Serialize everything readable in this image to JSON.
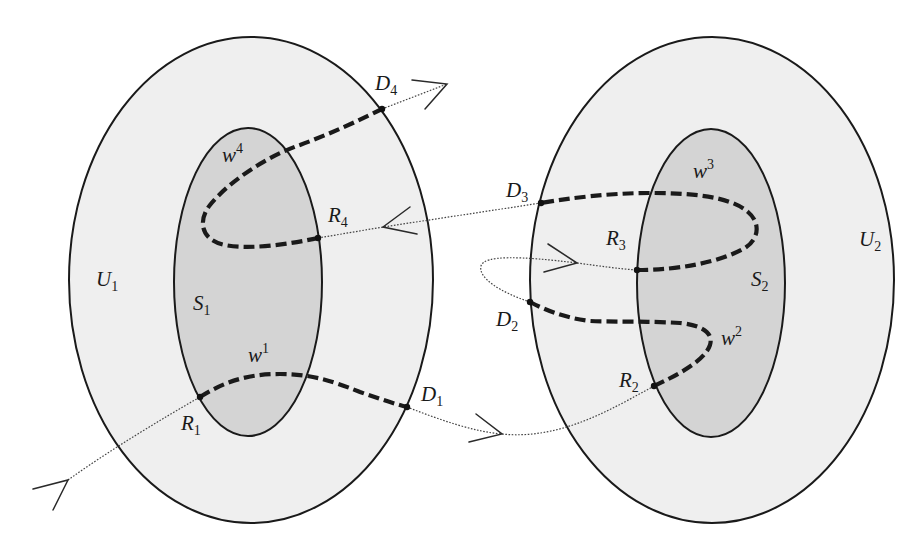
{
  "diagram": {
    "type": "set-trajectory-diagram",
    "regions": [
      {
        "id": "U1",
        "name": "U",
        "index": "1",
        "kind": "outer",
        "fill": "#efefef"
      },
      {
        "id": "S1",
        "name": "S",
        "index": "1",
        "kind": "inner",
        "fill": "#d4d4d4"
      },
      {
        "id": "U2",
        "name": "U",
        "index": "2",
        "kind": "outer",
        "fill": "#efefef"
      },
      {
        "id": "S2",
        "name": "S",
        "index": "2",
        "kind": "inner",
        "fill": "#d4d4d4"
      }
    ],
    "points": [
      {
        "id": "R1",
        "name": "R",
        "index": "1"
      },
      {
        "id": "D1",
        "name": "D",
        "index": "1"
      },
      {
        "id": "R2",
        "name": "R",
        "index": "2"
      },
      {
        "id": "D2",
        "name": "D",
        "index": "2"
      },
      {
        "id": "R3",
        "name": "R",
        "index": "3"
      },
      {
        "id": "D3",
        "name": "D",
        "index": "3"
      },
      {
        "id": "R4",
        "name": "R",
        "index": "4"
      },
      {
        "id": "D4",
        "name": "D",
        "index": "4"
      }
    ],
    "walks": [
      {
        "id": "w1",
        "name": "w",
        "sup": "1",
        "from": "R1",
        "to": "D1",
        "region": "U1"
      },
      {
        "id": "w2",
        "name": "w",
        "sup": "2",
        "from": "R2",
        "to": "D2",
        "region": "U2"
      },
      {
        "id": "w3",
        "name": "w",
        "sup": "3",
        "from": "R3",
        "to": "D3",
        "region": "U2"
      },
      {
        "id": "w4",
        "name": "w",
        "sup": "4",
        "from": "R4",
        "to": "D4",
        "region": "U1"
      }
    ],
    "trajectory_order": [
      "R1",
      "D1",
      "R2",
      "D2",
      "R3",
      "D3",
      "R4",
      "D4"
    ],
    "legend": {
      "thick_dashed": "walk segment w^k",
      "dotted_arrow": "trajectory between regions"
    }
  },
  "labels": {
    "U1": {
      "base": "U",
      "sub": "1"
    },
    "U2": {
      "base": "U",
      "sub": "2"
    },
    "S1": {
      "base": "S",
      "sub": "1"
    },
    "S2": {
      "base": "S",
      "sub": "2"
    },
    "R1": {
      "base": "R",
      "sub": "1"
    },
    "R2": {
      "base": "R",
      "sub": "2"
    },
    "R3": {
      "base": "R",
      "sub": "3"
    },
    "R4": {
      "base": "R",
      "sub": "4"
    },
    "D1": {
      "base": "D",
      "sub": "1"
    },
    "D2": {
      "base": "D",
      "sub": "2"
    },
    "D3": {
      "base": "D",
      "sub": "3"
    },
    "D4": {
      "base": "D",
      "sub": "4"
    },
    "w1": {
      "base": "w",
      "sup": "1"
    },
    "w2": {
      "base": "w",
      "sup": "2"
    },
    "w3": {
      "base": "w",
      "sup": "3"
    },
    "w4": {
      "base": "w",
      "sup": "4"
    }
  },
  "colors": {
    "outer_fill": "#efefef",
    "inner_fill": "#d4d4d4",
    "stroke": "#1a1a1a",
    "background": "#ffffff"
  }
}
